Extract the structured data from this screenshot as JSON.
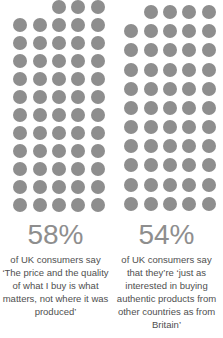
{
  "chart_data": {
    "type": "bar",
    "title": "",
    "subtitle": "",
    "xlabel": "",
    "ylabel": "",
    "units": "percent",
    "notation": "pictogram dot grid, 1 dot = 1 percent, 5 dots per row",
    "categories": [
      "The price and the quality of what I buy is what matters, not where it was produced",
      "Just as interested in buying authentic products from other countries as from Britain"
    ],
    "values": [
      58,
      54
    ],
    "ylim": [
      0,
      100
    ],
    "grid": false,
    "legend": "none",
    "dot_color": "#8e8e8e",
    "percent_color": "#8e8e8e",
    "caption_color": "#4f4f4f",
    "background": "#ffffff"
  },
  "stats": [
    {
      "value": 58,
      "percent_label": "58%",
      "caption": "of UK consumers say ‘The price and the quality of what I buy is what matters, not where it was produced’",
      "dots_total": 58,
      "dots_per_row": 5,
      "full_rows": 11,
      "top_row_dots": 3
    },
    {
      "value": 54,
      "percent_label": "54%",
      "caption": "of UK consumers say that they’re ‘just as interested in buying authentic products from other countries as from Britain’",
      "dots_total": 54,
      "dots_per_row": 5,
      "full_rows": 10,
      "top_row_dots": 4
    }
  ]
}
